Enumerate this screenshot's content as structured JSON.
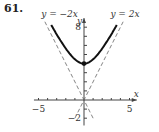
{
  "problem_number": "61.",
  "chart_data": {
    "type": "line",
    "title": "",
    "xlabel": "x",
    "ylabel": "y",
    "xlim": [
      -5.5,
      5.8
    ],
    "ylim": [
      -2.8,
      9
    ],
    "x_tick_labels": [
      {
        "value": -5,
        "label": "−5"
      },
      {
        "value": 5,
        "label": "5"
      }
    ],
    "y_tick_labels": [
      {
        "value": 8,
        "label": "8"
      },
      {
        "value": -2,
        "label": "−2"
      }
    ],
    "series": [
      {
        "name": "curve",
        "equation": "y = sqrt(4x^2 + 16)",
        "style": "solid-bold",
        "x_range": [
          -3.6,
          3.6
        ],
        "vertex": [
          0,
          4
        ]
      },
      {
        "name": "y = −2x",
        "label": "y = −2x",
        "style": "dashed",
        "slope": -2
      },
      {
        "name": "y = 2x",
        "label": "y = 2x",
        "style": "dashed",
        "slope": 2
      }
    ]
  }
}
